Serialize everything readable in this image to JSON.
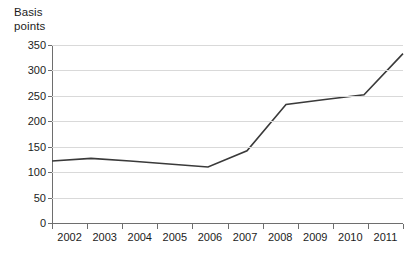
{
  "chart_data": {
    "type": "line",
    "title": "",
    "subtitle": "",
    "xlabel": "",
    "ylabel": "Basis\npoints",
    "categories": [
      "2002",
      "2003",
      "2004",
      "2005",
      "2006",
      "2007",
      "2008",
      "2009",
      "2010",
      "2011"
    ],
    "x": [
      2002,
      2003,
      2004,
      2005,
      2006,
      2007,
      2008,
      2009,
      2010,
      2011
    ],
    "values": [
      122,
      127,
      122,
      116,
      110,
      142,
      233,
      243,
      252,
      333
    ],
    "series": [
      {
        "name": "Basis points",
        "values": [
          122,
          127,
          122,
          116,
          110,
          142,
          233,
          243,
          252,
          333
        ]
      }
    ],
    "ylim": [
      0,
      350
    ],
    "yticks": [
      0,
      50,
      100,
      150,
      200,
      250,
      300,
      350
    ],
    "ytick_labels": [
      "0",
      "50",
      "100",
      "150",
      "200",
      "250",
      "300",
      "350"
    ],
    "xlim": [
      2002,
      2011
    ],
    "grid": "horizontal",
    "legend": "none",
    "line_color": "#3a3a3a",
    "gridline_color": "#d9d9d9",
    "axis_color": "#6e6e6e",
    "background_color": "#ffffff",
    "markers": false,
    "annotations": []
  }
}
